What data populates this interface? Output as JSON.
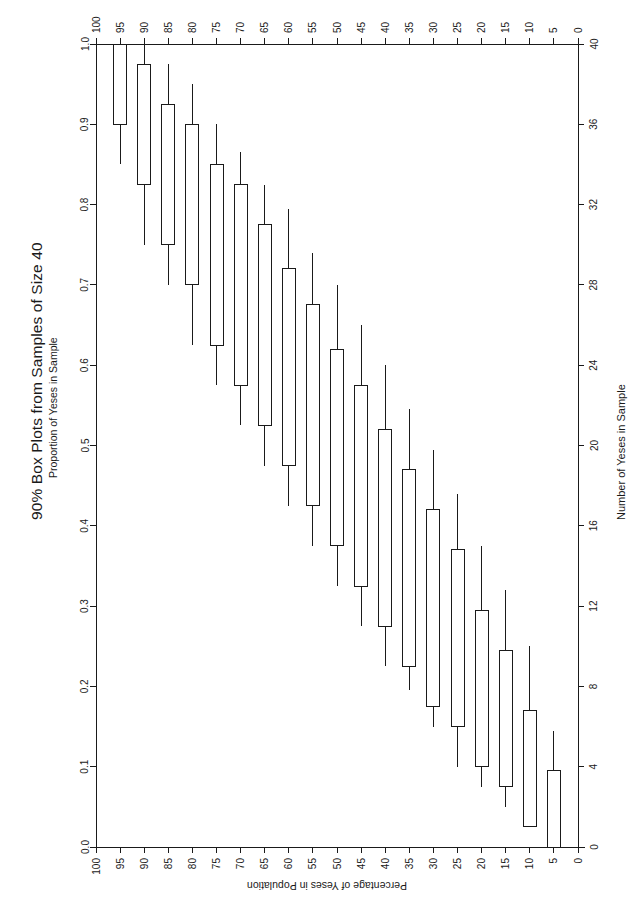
{
  "title": "90% Box Plots from Samples of Size 40",
  "subtitle": "Proportion of Yeses in Sample",
  "axes": {
    "left": {
      "label": "Proportion of Yeses in Sample",
      "ticks": [
        "0.0",
        "0.1",
        "0.2",
        "0.3",
        "0.4",
        "0.5",
        "0.6",
        "0.7",
        "0.8",
        "0.9",
        "1.0"
      ],
      "min": 0.0,
      "max": 1.0
    },
    "right": {
      "label": "Number of Yeses in Sample",
      "ticks": [
        "0",
        "4",
        "8",
        "12",
        "16",
        "20",
        "24",
        "28",
        "32",
        "36",
        "40"
      ],
      "min": 0,
      "max": 40
    },
    "top": {
      "label": "",
      "ticks": [
        "100",
        "95",
        "90",
        "85",
        "80",
        "75",
        "70",
        "65",
        "60",
        "55",
        "50",
        "45",
        "40",
        "35",
        "30",
        "25",
        "20",
        "15",
        "10",
        "5",
        "0"
      ]
    },
    "bottom": {
      "label": "Percentage of Yeses in Population",
      "ticks": [
        "100",
        "95",
        "90",
        "85",
        "80",
        "75",
        "70",
        "65",
        "60",
        "55",
        "50",
        "45",
        "40",
        "35",
        "30",
        "25",
        "20",
        "15",
        "10",
        "5",
        "0"
      ]
    }
  },
  "style": {
    "ink": "#1a1a1a",
    "paper": "#ffffff",
    "box_fill": "#ffffff"
  },
  "chart_data": {
    "type": "box",
    "title": "90% Box Plots from Samples of Size 40",
    "subtitle": "Proportion of Yeses in Sample",
    "xlabel": "Percentage of Yeses in Population",
    "ylabel": "Proportion of Yeses in Sample",
    "y2label": "Number of Yeses in Sample",
    "xlim": [
      100,
      0
    ],
    "ylim": [
      0.0,
      1.0
    ],
    "y2lim": [
      0,
      40
    ],
    "grid": false,
    "legend": null,
    "x_categories": [
      100,
      95,
      90,
      85,
      80,
      75,
      70,
      65,
      60,
      55,
      50,
      45,
      40,
      35,
      30,
      25,
      20,
      15,
      10,
      5,
      0
    ],
    "note": "Each box spans the central 90% interval of the sample proportion; whiskers mark the extreme 5% tails. q1=box bottom, q3=box top, lo=lower whisker, hi=upper whisker (proportion units).",
    "boxes": [
      {
        "x": 100,
        "lo": 1.0,
        "q1": 1.0,
        "q3": 1.0,
        "hi": 1.0
      },
      {
        "x": 95,
        "lo": 0.85,
        "q1": 0.9,
        "q3": 1.0,
        "hi": 1.0
      },
      {
        "x": 90,
        "lo": 0.75,
        "q1": 0.825,
        "q3": 0.975,
        "hi": 1.0
      },
      {
        "x": 85,
        "lo": 0.7,
        "q1": 0.75,
        "q3": 0.925,
        "hi": 0.975
      },
      {
        "x": 80,
        "lo": 0.625,
        "q1": 0.7,
        "q3": 0.9,
        "hi": 0.95
      },
      {
        "x": 75,
        "lo": 0.575,
        "q1": 0.625,
        "q3": 0.85,
        "hi": 0.9
      },
      {
        "x": 70,
        "lo": 0.525,
        "q1": 0.575,
        "q3": 0.825,
        "hi": 0.865
      },
      {
        "x": 65,
        "lo": 0.475,
        "q1": 0.525,
        "q3": 0.775,
        "hi": 0.825
      },
      {
        "x": 60,
        "lo": 0.425,
        "q1": 0.475,
        "q3": 0.72,
        "hi": 0.795
      },
      {
        "x": 55,
        "lo": 0.375,
        "q1": 0.425,
        "q3": 0.675,
        "hi": 0.74
      },
      {
        "x": 50,
        "lo": 0.325,
        "q1": 0.375,
        "q3": 0.62,
        "hi": 0.7
      },
      {
        "x": 45,
        "lo": 0.275,
        "q1": 0.325,
        "q3": 0.575,
        "hi": 0.65
      },
      {
        "x": 40,
        "lo": 0.225,
        "q1": 0.275,
        "q3": 0.52,
        "hi": 0.6
      },
      {
        "x": 35,
        "lo": 0.195,
        "q1": 0.225,
        "q3": 0.47,
        "hi": 0.545
      },
      {
        "x": 30,
        "lo": 0.15,
        "q1": 0.175,
        "q3": 0.42,
        "hi": 0.495
      },
      {
        "x": 25,
        "lo": 0.1,
        "q1": 0.15,
        "q3": 0.37,
        "hi": 0.44
      },
      {
        "x": 20,
        "lo": 0.075,
        "q1": 0.1,
        "q3": 0.295,
        "hi": 0.375
      },
      {
        "x": 15,
        "lo": 0.05,
        "q1": 0.075,
        "q3": 0.245,
        "hi": 0.32
      },
      {
        "x": 10,
        "lo": 0.025,
        "q1": 0.025,
        "q3": 0.17,
        "hi": 0.25
      },
      {
        "x": 5,
        "lo": 0.0,
        "q1": 0.0,
        "q3": 0.095,
        "hi": 0.145
      },
      {
        "x": 0,
        "lo": 0.0,
        "q1": 0.0,
        "q3": 0.0,
        "hi": 0.0
      }
    ]
  }
}
